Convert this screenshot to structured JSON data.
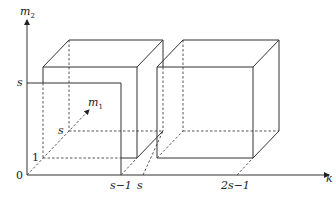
{
  "axes": {
    "vertical": {
      "name": "m",
      "subscript": "2"
    },
    "horizontal": {
      "name": "k"
    },
    "depth": {
      "name": "m",
      "subscript": "1"
    }
  },
  "tick_labels": {
    "origin": "0",
    "vertical_s": "s",
    "vertical_1": "1",
    "depth_s": "s",
    "k_s_minus_1": "s−1",
    "k_s": "s",
    "k_2s_minus_1": "2s−1"
  },
  "colors": {
    "line": "#333333",
    "background": "#ffffff"
  }
}
